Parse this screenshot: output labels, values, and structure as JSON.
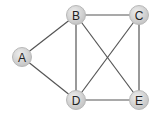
{
  "graph": {
    "nodes": [
      {
        "id": "A",
        "label": "A",
        "x": 22,
        "y": 57
      },
      {
        "id": "B",
        "label": "B",
        "x": 76,
        "y": 15
      },
      {
        "id": "C",
        "label": "C",
        "x": 139,
        "y": 15
      },
      {
        "id": "D",
        "label": "D",
        "x": 76,
        "y": 100
      },
      {
        "id": "E",
        "label": "E",
        "x": 139,
        "y": 100
      }
    ],
    "edges": [
      [
        "A",
        "B"
      ],
      [
        "A",
        "D"
      ],
      [
        "B",
        "C"
      ],
      [
        "B",
        "D"
      ],
      [
        "B",
        "E"
      ],
      [
        "C",
        "D"
      ],
      [
        "C",
        "E"
      ],
      [
        "D",
        "E"
      ]
    ],
    "colors": {
      "node_fill": "#d4d4d4",
      "node_stroke": "#b8b8b8",
      "edge": "#555555",
      "label": "#222222"
    }
  }
}
